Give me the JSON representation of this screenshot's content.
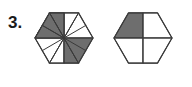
{
  "page": {
    "width": 192,
    "height": 87,
    "background_color": "#ffffff"
  },
  "problem": {
    "number_label": "3."
  },
  "colors": {
    "shaded_fill": "#6e6e6e",
    "unshaded_fill": "#ffffff",
    "stroke": "#3a3a3a",
    "label_text": "#1a1a1a"
  },
  "figures": [
    {
      "id": "hexagon-twelfths",
      "name": "left-hexagon",
      "shape": "hexagon",
      "orientation": "pointy-left-right",
      "center": {
        "x": 64,
        "y": 38
      },
      "radius": 29,
      "partition": {
        "type": "radial-sectors",
        "total_parts": 12,
        "shaded_parts": 3,
        "fraction_text": "3/12"
      },
      "shaded_sector_indices": [
        6,
        7,
        8
      ],
      "sector_fills": [
        "#ffffff",
        "#ffffff",
        "#ffffff",
        "#ffffff",
        "#ffffff",
        "#ffffff",
        "#6e6e6e",
        "#6e6e6e",
        "#6e6e6e",
        "#ffffff",
        "#ffffff",
        "#ffffff"
      ]
    },
    {
      "id": "hexagon-quarters",
      "name": "right-hexagon",
      "shape": "hexagon",
      "orientation": "pointy-left-right",
      "center": {
        "x": 143,
        "y": 38
      },
      "radius": 29,
      "partition": {
        "type": "quadrants",
        "total_parts": 4,
        "shaded_parts": 1,
        "fraction_text": "1/4"
      },
      "shaded_quadrant": "top-left",
      "quadrant_fills": {
        "top_left": "#6e6e6e",
        "top_right": "#ffffff",
        "bottom_left": "#ffffff",
        "bottom_right": "#ffffff"
      }
    }
  ]
}
